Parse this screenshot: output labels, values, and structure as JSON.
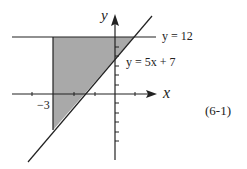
{
  "diagram": {
    "axis_x_label": "x",
    "axis_y_label": "y",
    "line_horizontal_label": "y = 12",
    "line_slanted_label": "y = 5x + 7",
    "x_tick_label": "−3",
    "equation_number": "(6-1)",
    "colors": {
      "shade": "#a9a9a9",
      "stroke": "#222222",
      "background": "#ffffff"
    }
  }
}
